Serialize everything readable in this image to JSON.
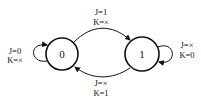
{
  "diagram": {
    "type": "state-diagram",
    "states": [
      {
        "id": "0",
        "label": "0"
      },
      {
        "id": "1",
        "label": "1"
      }
    ],
    "transitions": [
      {
        "from": "0",
        "to": "0",
        "label_line1": "J=0",
        "label_line2": "K=×"
      },
      {
        "from": "0",
        "to": "1",
        "label_line1": "J=1",
        "label_line2": "K=×"
      },
      {
        "from": "1",
        "to": "1",
        "label_line1": "J=×",
        "label_line2": "K=0"
      },
      {
        "from": "1",
        "to": "0",
        "label_line1": "J=×",
        "label_line2": "K=1"
      }
    ]
  }
}
